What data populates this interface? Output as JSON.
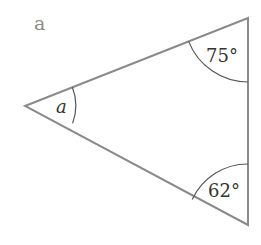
{
  "figure": {
    "label": "a",
    "shape": "triangle",
    "vertices": {
      "left": [
        25,
        106
      ],
      "top": [
        248,
        18
      ],
      "bottom": [
        248,
        225
      ]
    },
    "angles": [
      {
        "vertex": "left",
        "label": "a",
        "italic": true
      },
      {
        "vertex": "top",
        "label": "75°"
      },
      {
        "vertex": "bottom",
        "label": "62°"
      }
    ],
    "colors": {
      "stroke": "#8a8a8a",
      "arc": "#555555",
      "text": "#333333"
    }
  }
}
